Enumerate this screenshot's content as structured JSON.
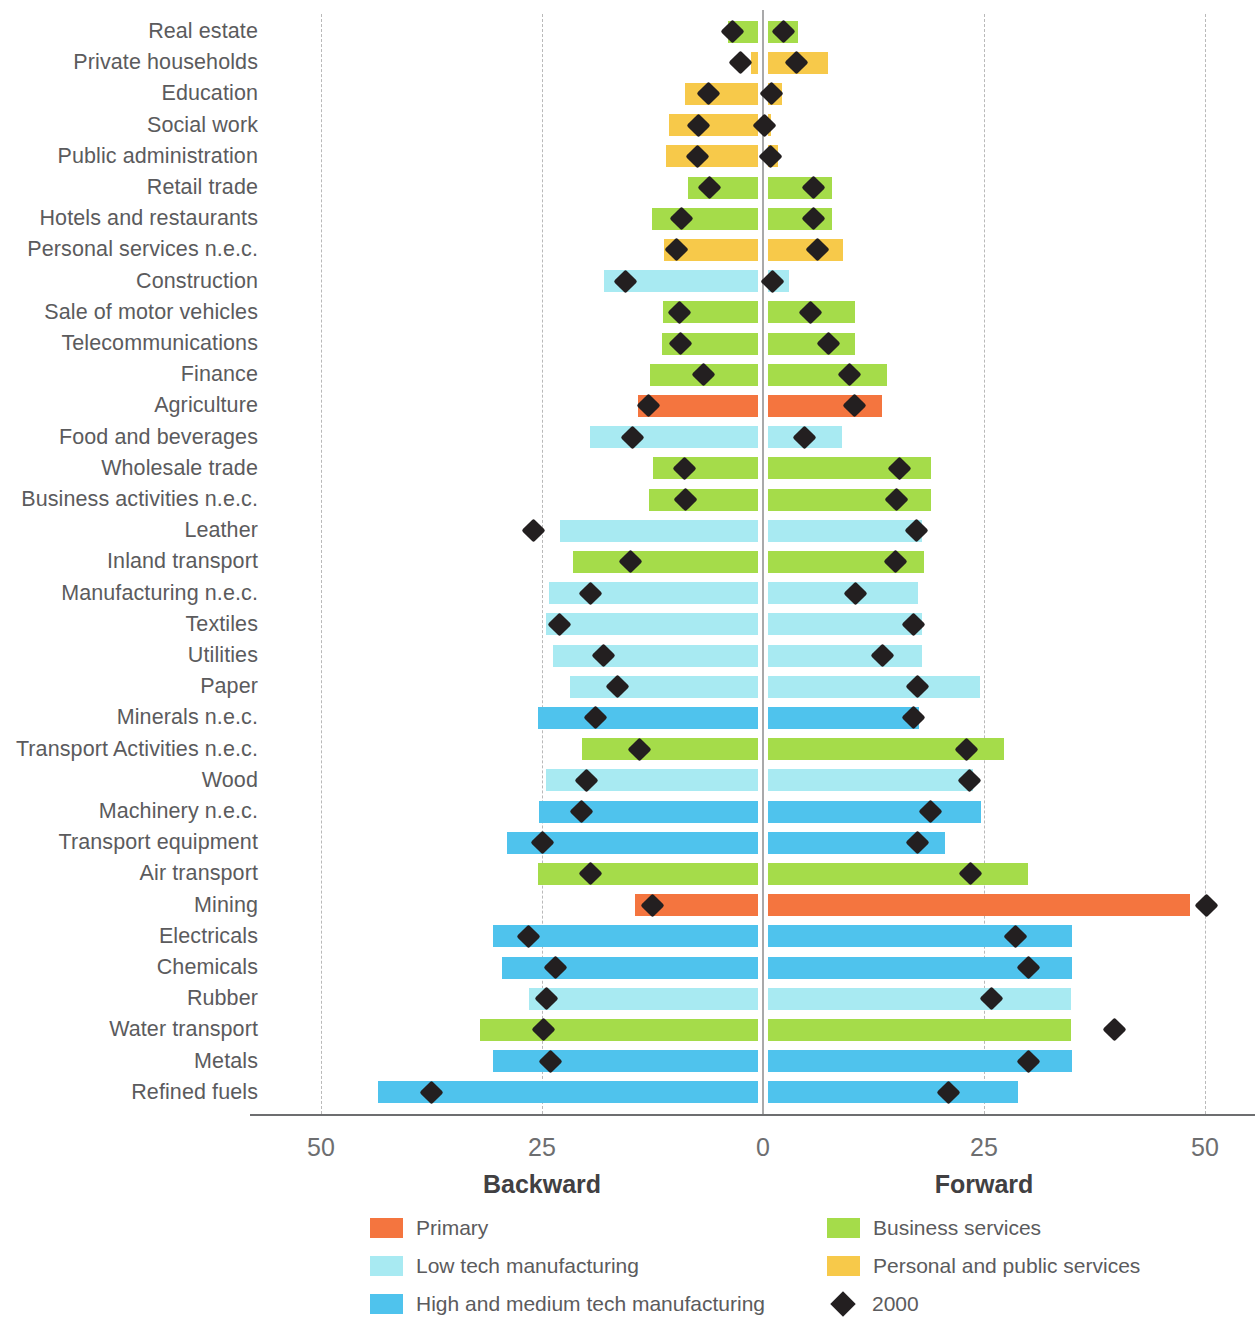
{
  "axis": {
    "ticks": [
      {
        "label": "50",
        "value": -50
      },
      {
        "label": "25",
        "value": -25
      },
      {
        "label": "0",
        "value": 0
      },
      {
        "label": "25",
        "value": 25
      },
      {
        "label": "50",
        "value": 50
      }
    ],
    "left_direction_label": "Backward",
    "right_direction_label": "Forward"
  },
  "legend": {
    "items": [
      {
        "label": "Primary",
        "color": "#f4753f",
        "type": "swatch"
      },
      {
        "label": "Low tech manufacturing",
        "color": "#a8eaf2",
        "type": "swatch"
      },
      {
        "label": "High and medium tech manufacturing",
        "color": "#4fc3ed",
        "type": "swatch"
      },
      {
        "label": "Business services",
        "color": "#a5dc4a",
        "type": "swatch"
      },
      {
        "label": "Personal and public services",
        "color": "#f7c94a",
        "type": "swatch"
      },
      {
        "label": "2000",
        "color": "#231f20",
        "type": "diamond"
      }
    ]
  },
  "colors": {
    "primary": "#f4753f",
    "low_tech_manufacturing": "#a8eaf2",
    "high_medium_tech_manufacturing": "#4fc3ed",
    "business_services": "#a5dc4a",
    "personal_public_services": "#f7c94a",
    "marker": "#231f20",
    "gridline": "#b9b9b9",
    "zeroline": "#a9a9aa",
    "axis": "#6d6e70",
    "text": "#5b5b5d"
  },
  "chart_data": {
    "type": "bar",
    "title": "",
    "subtitle": "",
    "xlabel": "",
    "ylabel": "",
    "xlim": [
      -52,
      52
    ],
    "grid": true,
    "legend_position": "bottom",
    "orientation": "horizontal-diverging",
    "note": "Diverging horizontal bars. Backward linkages extend left of 0, forward linkages extend right of 0. Diamond markers show the value for the year 2000.",
    "series": [
      {
        "name": "Backward",
        "direction": "left"
      },
      {
        "name": "Forward",
        "direction": "right"
      },
      {
        "name": "2000",
        "type": "marker"
      }
    ],
    "categories": [
      "Real estate",
      "Private households",
      "Education",
      "Social work",
      "Public administration",
      "Retail trade",
      "Hotels and restaurants",
      "Personal services n.e.c.",
      "Construction",
      "Sale of motor vehicles",
      "Telecommunications",
      "Finance",
      "Agriculture",
      "Food and beverages",
      "Wholesale trade",
      "Business activities n.e.c.",
      "Leather",
      "Inland transport",
      "Manufacturing n.e.c.",
      "Textiles",
      "Utilities",
      "Paper",
      "Minerals n.e.c.",
      "Transport Activities n.e.c.",
      "Wood",
      "Machinery n.e.c.",
      "Transport equipment",
      "Air transport",
      "Mining",
      "Electricals",
      "Chemicals",
      "Rubber",
      "Water transport",
      "Metals",
      "Refined fuels"
    ],
    "rows": [
      {
        "category": "Real estate",
        "group": "business_services",
        "backward": 4.0,
        "forward": 4.0,
        "backward_2000": 3.4,
        "forward_2000": 2.3
      },
      {
        "category": "Private households",
        "group": "personal_public_services",
        "backward": 1.4,
        "forward": 7.4,
        "backward_2000": 2.6,
        "forward_2000": 3.8
      },
      {
        "category": "Education",
        "group": "personal_public_services",
        "backward": 8.8,
        "forward": 2.1,
        "backward_2000": 6.2,
        "forward_2000": 1.0
      },
      {
        "category": "Social work",
        "group": "personal_public_services",
        "backward": 10.6,
        "forward": 0.9,
        "backward_2000": 7.3,
        "forward_2000": 0.2
      },
      {
        "category": "Public administration",
        "group": "personal_public_services",
        "backward": 11.0,
        "forward": 1.7,
        "backward_2000": 7.4,
        "forward_2000": 0.9
      },
      {
        "category": "Retail trade",
        "group": "business_services",
        "backward": 8.5,
        "forward": 7.8,
        "backward_2000": 6.0,
        "forward_2000": 5.7
      },
      {
        "category": "Hotels and restaurants",
        "group": "business_services",
        "backward": 12.6,
        "forward": 7.8,
        "backward_2000": 9.2,
        "forward_2000": 5.7
      },
      {
        "category": "Personal services n.e.c.",
        "group": "personal_public_services",
        "backward": 11.2,
        "forward": 9.1,
        "backward_2000": 9.8,
        "forward_2000": 6.2
      },
      {
        "category": "Construction",
        "group": "low_tech_manufacturing",
        "backward": 18.0,
        "forward": 2.9,
        "backward_2000": 15.5,
        "forward_2000": 1.1
      },
      {
        "category": "Sale of motor vehicles",
        "group": "business_services",
        "backward": 11.3,
        "forward": 10.4,
        "backward_2000": 9.4,
        "forward_2000": 5.4
      },
      {
        "category": "Telecommunications",
        "group": "business_services",
        "backward": 11.4,
        "forward": 10.4,
        "backward_2000": 9.3,
        "forward_2000": 7.4
      },
      {
        "category": "Finance",
        "group": "business_services",
        "backward": 12.8,
        "forward": 14.0,
        "backward_2000": 6.7,
        "forward_2000": 9.8
      },
      {
        "category": "Agriculture",
        "group": "primary",
        "backward": 14.1,
        "forward": 13.5,
        "backward_2000": 13.0,
        "forward_2000": 10.4
      },
      {
        "category": "Food and beverages",
        "group": "low_tech_manufacturing",
        "backward": 19.6,
        "forward": 8.9,
        "backward_2000": 14.8,
        "forward_2000": 4.7
      },
      {
        "category": "Wholesale trade",
        "group": "business_services",
        "backward": 12.5,
        "forward": 19.0,
        "backward_2000": 8.9,
        "forward_2000": 15.4
      },
      {
        "category": "Business activities n.e.c.",
        "group": "business_services",
        "backward": 12.9,
        "forward": 19.0,
        "backward_2000": 8.8,
        "forward_2000": 15.1
      },
      {
        "category": "Leather",
        "group": "low_tech_manufacturing",
        "backward": 23.0,
        "forward": 18.0,
        "backward_2000": 26.0,
        "forward_2000": 17.4
      },
      {
        "category": "Inland transport",
        "group": "business_services",
        "backward": 21.5,
        "forward": 18.2,
        "backward_2000": 15.0,
        "forward_2000": 15.0
      },
      {
        "category": "Manufacturing n.e.c.",
        "group": "low_tech_manufacturing",
        "backward": 24.2,
        "forward": 17.5,
        "backward_2000": 19.5,
        "forward_2000": 10.5
      },
      {
        "category": "Textiles",
        "group": "low_tech_manufacturing",
        "backward": 24.5,
        "forward": 18.0,
        "backward_2000": 23.0,
        "forward_2000": 17.0
      },
      {
        "category": "Utilities",
        "group": "low_tech_manufacturing",
        "backward": 23.8,
        "forward": 18.0,
        "backward_2000": 18.0,
        "forward_2000": 13.5
      },
      {
        "category": "Paper",
        "group": "low_tech_manufacturing",
        "backward": 21.8,
        "forward": 24.6,
        "backward_2000": 16.5,
        "forward_2000": 17.5
      },
      {
        "category": "Minerals n.e.c.",
        "group": "high_medium_tech_manufacturing",
        "backward": 25.5,
        "forward": 17.7,
        "backward_2000": 19.0,
        "forward_2000": 17.0
      },
      {
        "category": "Transport Activities n.e.c.",
        "group": "business_services",
        "backward": 20.5,
        "forward": 27.3,
        "backward_2000": 14.0,
        "forward_2000": 23.0
      },
      {
        "category": "Wood",
        "group": "low_tech_manufacturing",
        "backward": 24.5,
        "forward": 23.7,
        "backward_2000": 20.0,
        "forward_2000": 23.4
      },
      {
        "category": "Machinery n.e.c.",
        "group": "high_medium_tech_manufacturing",
        "backward": 25.3,
        "forward": 24.7,
        "backward_2000": 20.5,
        "forward_2000": 19.0
      },
      {
        "category": "Transport equipment",
        "group": "high_medium_tech_manufacturing",
        "backward": 29.0,
        "forward": 20.6,
        "backward_2000": 25.0,
        "forward_2000": 17.5
      },
      {
        "category": "Air transport",
        "group": "business_services",
        "backward": 25.5,
        "forward": 30.0,
        "backward_2000": 19.5,
        "forward_2000": 23.5
      },
      {
        "category": "Mining",
        "group": "primary",
        "backward": 14.5,
        "forward": 48.3,
        "backward_2000": 12.5,
        "forward_2000": 50.2
      },
      {
        "category": "Electricals",
        "group": "high_medium_tech_manufacturing",
        "backward": 30.5,
        "forward": 35.0,
        "backward_2000": 26.5,
        "forward_2000": 28.6
      },
      {
        "category": "Chemicals",
        "group": "high_medium_tech_manufacturing",
        "backward": 29.5,
        "forward": 35.0,
        "backward_2000": 23.5,
        "forward_2000": 30.0
      },
      {
        "category": "Rubber",
        "group": "low_tech_manufacturing",
        "backward": 26.5,
        "forward": 34.8,
        "backward_2000": 24.5,
        "forward_2000": 25.8
      },
      {
        "category": "Water transport",
        "group": "business_services",
        "backward": 32.0,
        "forward": 34.8,
        "backward_2000": 24.8,
        "forward_2000": 39.8
      },
      {
        "category": "Metals",
        "group": "high_medium_tech_manufacturing",
        "backward": 30.5,
        "forward": 35.0,
        "backward_2000": 24.0,
        "forward_2000": 30.0
      },
      {
        "category": "Refined fuels",
        "group": "high_medium_tech_manufacturing",
        "backward": 43.5,
        "forward": 28.8,
        "backward_2000": 37.5,
        "forward_2000": 21.0
      }
    ]
  }
}
